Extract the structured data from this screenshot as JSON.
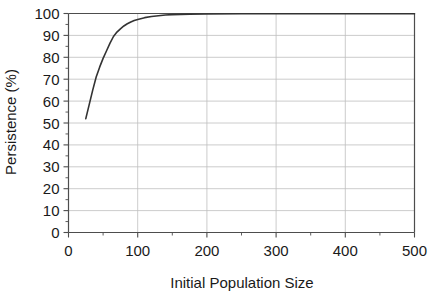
{
  "chart_data": {
    "type": "line",
    "title": "",
    "xlabel": "Initial Population Size",
    "ylabel": "Persistence (%)",
    "xlim": [
      0,
      500
    ],
    "ylim": [
      0,
      100
    ],
    "xticks": [
      0,
      100,
      200,
      300,
      400,
      500
    ],
    "xtick_labels": [
      "0",
      "100",
      "200",
      "300",
      "400",
      "500"
    ],
    "xminor_ticks": [
      50,
      150,
      250,
      350,
      450
    ],
    "yticks": [
      0,
      10,
      20,
      30,
      40,
      50,
      60,
      70,
      80,
      90,
      100
    ],
    "ytick_labels": [
      "0",
      "10",
      "20",
      "30",
      "40",
      "50",
      "60",
      "70",
      "80",
      "90",
      "100"
    ],
    "yminor_ticks": [
      5,
      15,
      25,
      35,
      45,
      55,
      65,
      75,
      85,
      95
    ],
    "grid": "both",
    "grid_color": "#bfbfbf",
    "frame_color": "#4d4d4d",
    "line_color": "#333333",
    "line_width": 1.6,
    "legend": "none",
    "series": [
      {
        "name": "Persistence",
        "x": [
          25,
          30,
          35,
          40,
          45,
          50,
          55,
          60,
          65,
          70,
          75,
          80,
          85,
          90,
          95,
          100,
          110,
          120,
          130,
          140,
          150,
          175,
          200,
          250,
          300,
          350,
          400,
          450,
          500
        ],
        "values": [
          52.0,
          58.5,
          65.0,
          71.0,
          75.5,
          79.5,
          83.0,
          86.5,
          89.5,
          91.5,
          93.0,
          94.3,
          95.3,
          96.1,
          96.8,
          97.3,
          98.1,
          98.6,
          99.0,
          99.3,
          99.5,
          99.7,
          99.8,
          99.9,
          99.9,
          99.9,
          99.9,
          99.9,
          99.9
        ]
      }
    ]
  }
}
